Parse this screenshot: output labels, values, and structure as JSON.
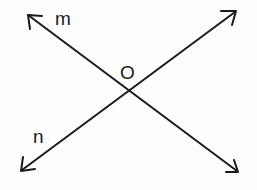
{
  "diagram": {
    "type": "intersecting-lines",
    "labels": {
      "line_1": "m",
      "line_2": "n",
      "intersection": "O"
    },
    "colors": {
      "stroke": "#1a1a1a",
      "background": "#fdfdfd"
    },
    "lines": [
      {
        "name": "m",
        "from": [
          27,
          14
        ],
        "to": [
          238,
          172
        ],
        "arrows": "both"
      },
      {
        "name": "n",
        "from": [
          21,
          171
        ],
        "to": [
          236,
          11
        ],
        "arrows": "both"
      }
    ],
    "intersection_point": [
      128,
      89
    ]
  }
}
